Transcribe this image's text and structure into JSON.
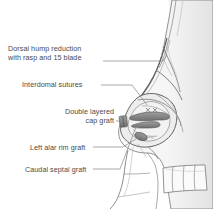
{
  "figure": {
    "background_color": "#ffffff",
    "text_color": "#4a4a4a",
    "line_color": "#8c8c8c",
    "graft_color": "#8a8a8a",
    "skin_shade": "#f2f2f2",
    "cartilage_shade": "#e6e6e6"
  },
  "labels": [
    {
      "id": "dorsal-hump-reduction",
      "line1": "Dorsal hump reduction",
      "line2": "with rasp and 15 blade"
    },
    {
      "id": "interdomal-sutures",
      "line1": "Interdomal sutures",
      "line2": ""
    },
    {
      "id": "double-layered-cap-graft",
      "line1": "Double layered",
      "line2": "cap graft"
    },
    {
      "id": "left-alar-rim-graft",
      "line1": "Left alar rim graft",
      "line2": ""
    },
    {
      "id": "caudal-septal-graft",
      "line1": "Caudal septal graft",
      "line2": ""
    }
  ]
}
